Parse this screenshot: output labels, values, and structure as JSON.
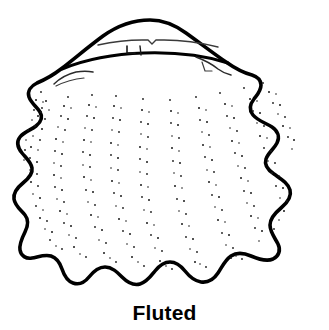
{
  "figure": {
    "caption": "Fluted",
    "style": "black-and-white ink line drawing with stippled radial ribs",
    "colors": {
      "background": "#ffffff",
      "outline": "#000000",
      "stipple": "#1a1a1a",
      "interior_line": "#2b2b2b",
      "caption": "#000000"
    },
    "canvas": {
      "width": 329,
      "height": 330,
      "drawing_height": 300
    },
    "shell": {
      "name": "fluted-scallop-shell",
      "outline_extents": {
        "top_apex_x": 150,
        "top_apex_y": 19,
        "left_x": 19,
        "right_x": 310,
        "bottom_y": 286
      },
      "margin_type": "scalloped-wavy",
      "bottom_lobe_count": 7,
      "left_lobe_count": 4,
      "right_lobe_count": 4,
      "rib_count": 11,
      "hinge": {
        "name": "hinge-line",
        "has_left_auricle": true,
        "has_right_auricle": true,
        "has_byssal_notch": true
      }
    }
  }
}
